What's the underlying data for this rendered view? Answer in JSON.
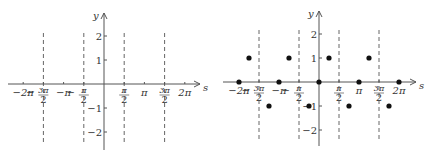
{
  "panels": [
    {
      "id": "left",
      "origin": {
        "x": 104,
        "y": 84
      },
      "unit_x_per_halfpi": 20.2,
      "unit_y": 24,
      "x_axis": {
        "from": 8,
        "to": 200,
        "label": "s"
      },
      "y_axis": {
        "from": 150,
        "to": 13,
        "label": "y"
      },
      "dashed_x": [
        -3,
        -1,
        1,
        3
      ],
      "dash_range": [
        33,
        144
      ],
      "points": []
    },
    {
      "id": "right",
      "origin": {
        "x": 319,
        "y": 82
      },
      "unit_x_per_halfpi": 20.0,
      "unit_y": 24,
      "x_axis": {
        "from": 223,
        "to": 416,
        "label": "s"
      },
      "y_axis": {
        "from": 146,
        "to": 11,
        "label": "y"
      },
      "dashed_x": [
        -3,
        -1,
        1,
        3
      ],
      "dash_range": [
        30,
        140
      ],
      "points": [
        {
          "s_halfpi": -4,
          "y": 0
        },
        {
          "s_halfpi": -3.5,
          "y": 1
        },
        {
          "s_halfpi": -2.5,
          "y": -1
        },
        {
          "s_halfpi": -2,
          "y": 0
        },
        {
          "s_halfpi": -1.5,
          "y": 1
        },
        {
          "s_halfpi": -0.5,
          "y": -1
        },
        {
          "s_halfpi": 0,
          "y": 0
        },
        {
          "s_halfpi": 0.5,
          "y": 1
        },
        {
          "s_halfpi": 1.5,
          "y": -1
        },
        {
          "s_halfpi": 2,
          "y": 0
        },
        {
          "s_halfpi": 2.5,
          "y": 1
        },
        {
          "s_halfpi": 3.5,
          "y": -1
        },
        {
          "s_halfpi": 4,
          "y": 0
        }
      ]
    }
  ],
  "x_ticks": [
    {
      "halfpi": -4,
      "label": "−2π",
      "type": "plain"
    },
    {
      "halfpi": -3,
      "label_num": "3π",
      "label_den": "2",
      "sign": "−",
      "type": "frac"
    },
    {
      "halfpi": -2,
      "label": "−π",
      "type": "plain"
    },
    {
      "halfpi": -1,
      "label_num": "π",
      "label_den": "2",
      "sign": "−",
      "type": "frac"
    },
    {
      "halfpi": 1,
      "label_num": "π",
      "label_den": "2",
      "sign": "",
      "type": "frac"
    },
    {
      "halfpi": 2,
      "label": "π",
      "type": "plain"
    },
    {
      "halfpi": 3,
      "label_num": "3π",
      "label_den": "2",
      "sign": "",
      "type": "frac"
    },
    {
      "halfpi": 4,
      "label": "2π",
      "type": "plain"
    }
  ],
  "y_ticks": [
    {
      "value": 2,
      "label": "2"
    },
    {
      "value": 1,
      "label": "1"
    },
    {
      "value": -1,
      "label": "−1"
    },
    {
      "value": -2,
      "label": "−2"
    }
  ]
}
